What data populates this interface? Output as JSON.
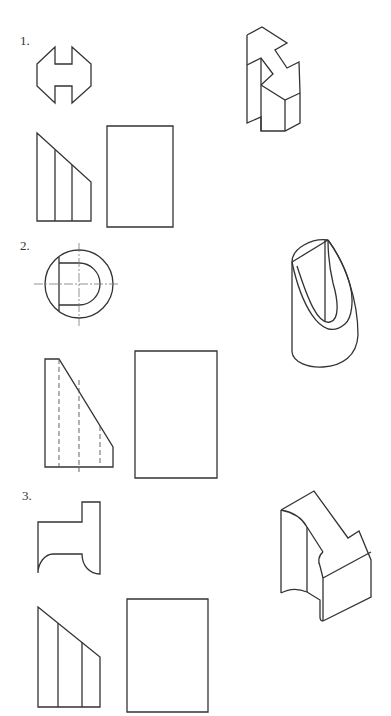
{
  "page": {
    "header_fragment": "",
    "problems": [
      {
        "label": "1.",
        "views": {
          "top_view": "H-shaped octagonal profile with notches top and bottom",
          "front_view": "trapezoid with sloped top and two vertical lines",
          "side_view": "empty rectangle (to be completed)",
          "isometric": "stepped block with V-cut notch"
        }
      },
      {
        "label": "2.",
        "views": {
          "top_view": "circle with D-shaped cutout and center lines",
          "front_view": "sloped profile with hidden (dashed) lines",
          "side_view": "empty rectangle (to be completed)",
          "isometric": "cylinder cut by inclined plane with U-groove"
        }
      },
      {
        "label": "3.",
        "views": {
          "top_view": "T-shaped profile with concave curves at bottom",
          "front_view": "trapezoid with sloped top and two vertical lines",
          "side_view": "empty rectangle (to be completed)",
          "isometric": "block with concave face and stepped top"
        }
      }
    ]
  }
}
